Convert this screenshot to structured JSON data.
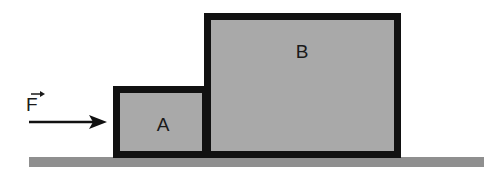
{
  "diagram": {
    "title": "",
    "force": {
      "symbol": "F",
      "vector": true,
      "direction": "right"
    },
    "blocks": [
      {
        "label": "A",
        "fill": "#a9a9a9",
        "border": "#111111"
      },
      {
        "label": "B",
        "fill": "#a9a9a9",
        "border": "#111111"
      }
    ],
    "surface": {
      "fill": "#8f8f8f"
    }
  }
}
